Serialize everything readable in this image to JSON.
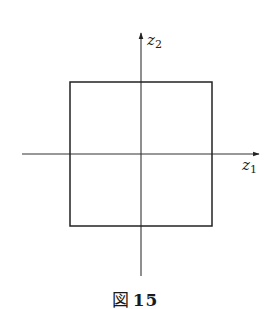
{
  "figure": {
    "caption_prefix": "図",
    "caption_number": "15",
    "axes": {
      "horizontal": {
        "label": "z",
        "subscript": "1"
      },
      "vertical": {
        "label": "z",
        "subscript": "2"
      }
    },
    "shape": "square centered at origin",
    "colors": {
      "stroke": "#222222",
      "background": "#ffffff"
    }
  }
}
